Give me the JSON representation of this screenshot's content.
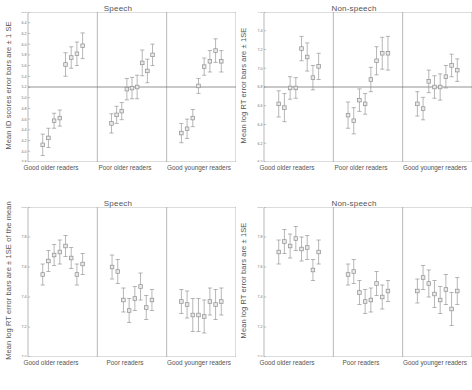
{
  "figure": {
    "width": 472,
    "height": 390,
    "marker_color": "#8f8f8f",
    "marker_fill": "#e8e8e8",
    "axis_color": "#9a9a9a",
    "text_color": "#555555"
  },
  "chart_data": [
    {
      "id": "top-left",
      "type": "scatter",
      "title": "Speech",
      "ylabel": "Mean ID scores error bars are ± 1 SE",
      "xlabel": "",
      "ylim": [
        3.8,
        6.6
      ],
      "yticks": [
        3.8,
        4.0,
        4.2,
        4.4,
        4.6,
        4.8,
        5.0,
        5.2,
        5.4,
        5.6,
        5.8,
        6.0,
        6.2,
        6.4,
        6.6
      ],
      "ytick_labels": [
        "3.8",
        "4.0",
        "4.2",
        "4.4",
        "4.6",
        "4.8",
        "5.0",
        "5.2",
        "5.4",
        "5.6",
        "5.8",
        "6.0",
        "6.2",
        "6.4",
        "6.6"
      ],
      "reference_line": 5.2,
      "grid": false,
      "groups": [
        "Good older readers",
        "Poor older readers",
        "Good younger readers"
      ],
      "series": [
        {
          "name": "Good older readers",
          "x": [
            1,
            2,
            3,
            4,
            5,
            6,
            7,
            8
          ],
          "values": [
            4.12,
            4.25,
            4.57,
            4.62,
            5.62,
            5.75,
            5.82,
            5.97
          ],
          "errors": [
            0.2,
            0.18,
            0.14,
            0.15,
            0.22,
            0.2,
            0.22,
            0.24
          ]
        },
        {
          "name": "Poor older readers",
          "x": [
            1,
            2,
            3,
            4,
            5,
            6,
            7,
            8
          ],
          "values": [
            4.52,
            4.68,
            4.75,
            5.16,
            5.18,
            5.2,
            5.65,
            5.5,
            5.8
          ],
          "errors": [
            0.18,
            0.16,
            0.16,
            0.2,
            0.2,
            0.22,
            0.24,
            0.22,
            0.2
          ]
        },
        {
          "name": "Good younger readers",
          "x": [
            1,
            2,
            3,
            4,
            5,
            6,
            7,
            8
          ],
          "values": [
            4.34,
            4.42,
            4.62,
            5.22,
            5.58,
            5.68,
            5.88,
            5.68
          ],
          "errors": [
            0.18,
            0.18,
            0.16,
            0.14,
            0.16,
            0.2,
            0.22,
            0.2
          ]
        }
      ]
    },
    {
      "id": "top-right",
      "type": "scatter",
      "title": "Non-speech",
      "ylabel": "Mean log RT error bars are ± 1SE",
      "xlabel": "",
      "ylim": [
        6.0,
        7.6
      ],
      "yticks": [
        6.0,
        6.2,
        6.4,
        6.6,
        6.8,
        7.0,
        7.2,
        7.4,
        7.6
      ],
      "ytick_labels": [
        "6.0",
        "6.2",
        "6.4",
        "6.6",
        "6.8",
        "7.0",
        "7.2",
        "7.4",
        "7.6"
      ],
      "reference_line": 6.8,
      "grid": false,
      "groups": [
        "Good older readers",
        "Poor older readers",
        "Good younger readers"
      ],
      "series": [
        {
          "name": "Good older readers",
          "x": [
            1,
            2,
            3,
            4,
            5,
            6,
            7
          ],
          "values": [
            6.62,
            6.58,
            6.79,
            6.79,
            7.21,
            7.12,
            6.9,
            7.02
          ],
          "errors": [
            0.14,
            0.15,
            0.12,
            0.11,
            0.13,
            0.15,
            0.13,
            0.14
          ]
        },
        {
          "name": "Poor older readers",
          "x": [
            1,
            2,
            3,
            4,
            5,
            6,
            7
          ],
          "values": [
            6.5,
            6.44,
            6.66,
            6.62,
            6.88,
            7.08,
            7.16,
            7.16
          ],
          "errors": [
            0.14,
            0.14,
            0.12,
            0.11,
            0.13,
            0.15,
            0.17,
            0.18
          ]
        },
        {
          "name": "Good younger readers",
          "x": [
            1,
            2,
            3,
            4,
            5,
            6,
            7
          ],
          "values": [
            6.62,
            6.57,
            6.86,
            6.8,
            6.8,
            6.91,
            7.03,
            6.98
          ],
          "errors": [
            0.13,
            0.12,
            0.12,
            0.12,
            0.14,
            0.12,
            0.12,
            0.12
          ]
        }
      ]
    },
    {
      "id": "bottom-left",
      "type": "scatter",
      "title": "Speech",
      "ylabel": "Mean log RT error bars are ± 1SE of the mean",
      "xlabel": "",
      "ylim": [
        7.0,
        8.0
      ],
      "yticks": [
        7.0,
        7.2,
        7.4,
        7.6,
        7.8,
        8.0
      ],
      "ytick_labels": [
        "7.0",
        "7.2",
        "7.4",
        "7.6",
        "7.8",
        "8.0"
      ],
      "reference_line": null,
      "grid": false,
      "groups": [
        "Good older readers",
        "Poor readers",
        "Good younger readers"
      ],
      "series": [
        {
          "name": "Good older readers",
          "x": [
            1,
            2,
            3,
            4,
            5,
            6,
            7,
            8
          ],
          "values": [
            7.55,
            7.64,
            7.68,
            7.7,
            7.74,
            7.66,
            7.55,
            7.62
          ],
          "errors": [
            0.07,
            0.07,
            0.07,
            0.08,
            0.07,
            0.07,
            0.07,
            0.07
          ]
        },
        {
          "name": "Poor readers",
          "x": [
            1,
            2,
            3,
            4,
            5,
            6,
            7
          ],
          "values": [
            7.6,
            7.57,
            7.38,
            7.31,
            7.39,
            7.47,
            7.33,
            7.38
          ],
          "errors": [
            0.08,
            0.08,
            0.08,
            0.08,
            0.08,
            0.09,
            0.08,
            0.07
          ]
        },
        {
          "name": "Good younger readers",
          "x": [
            1,
            2,
            3,
            4,
            5,
            6,
            7
          ],
          "values": [
            7.37,
            7.35,
            7.28,
            7.28,
            7.27,
            7.37,
            7.35,
            7.37
          ],
          "errors": [
            0.08,
            0.09,
            0.11,
            0.11,
            0.11,
            0.09,
            0.1,
            0.09
          ]
        }
      ]
    },
    {
      "id": "bottom-right",
      "type": "scatter",
      "title": "Non-speech",
      "ylabel": "Mean log RT error bars are ± 1SE",
      "xlabel": "",
      "ylim": [
        7.0,
        8.0
      ],
      "yticks": [
        7.0,
        7.2,
        7.4,
        7.6,
        7.8,
        8.0
      ],
      "ytick_labels": [
        "7.0",
        "7.2",
        "7.4",
        "7.6",
        "7.8",
        "8.0"
      ],
      "reference_line": null,
      "grid": false,
      "groups": [
        "Good older readers",
        "Poor readers",
        "Good younger readers"
      ],
      "series": [
        {
          "name": "Good older readers",
          "x": [
            1,
            2,
            3,
            4,
            5,
            6,
            7,
            8
          ],
          "values": [
            7.7,
            7.77,
            7.74,
            7.79,
            7.72,
            7.73,
            7.58,
            7.7
          ],
          "errors": [
            0.08,
            0.08,
            0.08,
            0.08,
            0.08,
            0.08,
            0.07,
            0.08
          ]
        },
        {
          "name": "Poor readers",
          "x": [
            1,
            2,
            3,
            4,
            5,
            6,
            7,
            8
          ],
          "values": [
            7.55,
            7.57,
            7.43,
            7.37,
            7.38,
            7.49,
            7.4,
            7.44
          ],
          "errors": [
            0.07,
            0.08,
            0.08,
            0.08,
            0.08,
            0.08,
            0.08,
            0.07
          ]
        },
        {
          "name": "Good younger readers",
          "x": [
            1,
            2,
            3,
            4,
            5,
            6,
            7,
            8
          ],
          "values": [
            7.44,
            7.53,
            7.49,
            7.42,
            7.38,
            7.45,
            7.32,
            7.44
          ],
          "errors": [
            0.08,
            0.08,
            0.09,
            0.09,
            0.09,
            0.1,
            0.11,
            0.09
          ]
        }
      ]
    }
  ]
}
